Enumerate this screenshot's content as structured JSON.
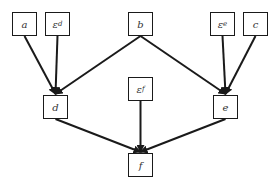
{
  "diagram": {
    "type": "directed-acyclic-graph",
    "nodes": [
      {
        "id": "a",
        "label": "a",
        "x": 12,
        "y": 12,
        "w": 25,
        "h": 24
      },
      {
        "id": "eps_d",
        "label": "ε",
        "sub": "d",
        "x": 45,
        "y": 12,
        "w": 25,
        "h": 24
      },
      {
        "id": "b",
        "label": "b",
        "x": 128,
        "y": 12,
        "w": 25,
        "h": 24
      },
      {
        "id": "eps_e",
        "label": "ε",
        "sub": "e",
        "x": 210,
        "y": 12,
        "w": 25,
        "h": 24
      },
      {
        "id": "c",
        "label": "c",
        "x": 243,
        "y": 12,
        "w": 25,
        "h": 24
      },
      {
        "id": "d",
        "label": "d",
        "x": 43,
        "y": 95,
        "w": 25,
        "h": 24
      },
      {
        "id": "eps_f",
        "label": "ε",
        "sub": "f",
        "x": 128,
        "y": 77,
        "w": 25,
        "h": 24
      },
      {
        "id": "e",
        "label": "e",
        "x": 213,
        "y": 95,
        "w": 25,
        "h": 24
      },
      {
        "id": "f",
        "label": "f",
        "x": 128,
        "y": 153,
        "w": 25,
        "h": 24
      }
    ],
    "edges": [
      {
        "from": "a",
        "to": "d"
      },
      {
        "from": "eps_d",
        "to": "d"
      },
      {
        "from": "b",
        "to": "d"
      },
      {
        "from": "b",
        "to": "e"
      },
      {
        "from": "eps_e",
        "to": "e"
      },
      {
        "from": "c",
        "to": "e"
      },
      {
        "from": "d",
        "to": "f"
      },
      {
        "from": "eps_f",
        "to": "f"
      },
      {
        "from": "e",
        "to": "f"
      }
    ],
    "colors": {
      "stroke": "#1a1a1a",
      "text": "#333333",
      "background": "#ffffff"
    }
  }
}
